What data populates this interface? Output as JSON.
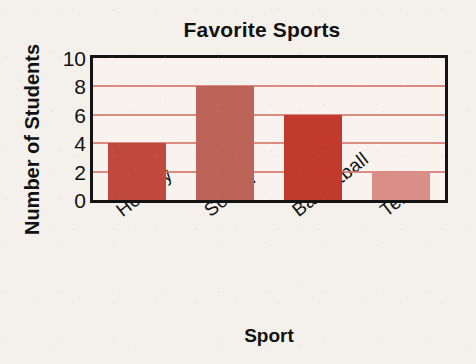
{
  "chart_data": {
    "type": "bar",
    "title": "Favorite Sports",
    "xlabel": "Sport",
    "ylabel": "Number of Students",
    "categories": [
      "Hockey",
      "Soccer",
      "Basketball",
      "Tennis"
    ],
    "values": [
      4,
      8,
      6,
      2
    ],
    "ylim": [
      0,
      10
    ],
    "ytick_labels": [
      "0",
      "2",
      "4",
      "6",
      "8",
      "10"
    ],
    "ytick_values": [
      0,
      2,
      4,
      6,
      8,
      10
    ],
    "gridlines_at": [
      2,
      4,
      6,
      8
    ],
    "grid": true,
    "legend": "none",
    "bar_colors": [
      "#c0483c",
      "#bd6459",
      "#c2392d",
      "#d98f87"
    ],
    "grid_color": "#d4796e",
    "axis_color": "#141414",
    "plot_background": "#faf2ee",
    "page_background": "#f4f1ed",
    "text_color": "#111111",
    "xtick_rotation_deg": -38
  }
}
